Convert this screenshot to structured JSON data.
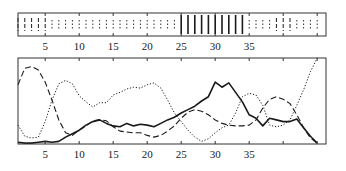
{
  "figure": {
    "width": 346,
    "height": 171,
    "line_color": "#1a1a1a",
    "frame_color": "#333333"
  },
  "chart_data": [
    {
      "type": "strip",
      "title": "",
      "xlabel": "",
      "ylabel": "",
      "xlim": [
        1,
        46.3
      ],
      "x_ticks": [
        5,
        10,
        15,
        20,
        25,
        30,
        35,
        40,
        45
      ],
      "x_tick_labels": [
        "5",
        "10",
        "15",
        "20",
        "25",
        "30",
        "35",
        "",
        ""
      ],
      "grid": false,
      "legend": null,
      "markers": [
        {
          "x": 1,
          "style": "dashed"
        },
        {
          "x": 2,
          "style": "dashed"
        },
        {
          "x": 3,
          "style": "dashed"
        },
        {
          "x": 4,
          "style": "dashed"
        },
        {
          "x": 5,
          "style": "dashed"
        },
        {
          "x": 6,
          "style": "dotted"
        },
        {
          "x": 7,
          "style": "dotted"
        },
        {
          "x": 8,
          "style": "dotted"
        },
        {
          "x": 9,
          "style": "dotted"
        },
        {
          "x": 10,
          "style": "dotted"
        },
        {
          "x": 11,
          "style": "dotted"
        },
        {
          "x": 12,
          "style": "dotted"
        },
        {
          "x": 13,
          "style": "dotted"
        },
        {
          "x": 14,
          "style": "dotted"
        },
        {
          "x": 15,
          "style": "dotted"
        },
        {
          "x": 16,
          "style": "dotted"
        },
        {
          "x": 17,
          "style": "dotted"
        },
        {
          "x": 18,
          "style": "dotted"
        },
        {
          "x": 19,
          "style": "dotted"
        },
        {
          "x": 20,
          "style": "dotted"
        },
        {
          "x": 21,
          "style": "dotted"
        },
        {
          "x": 22,
          "style": "dotted"
        },
        {
          "x": 23,
          "style": "dotted"
        },
        {
          "x": 24,
          "style": "dotted"
        },
        {
          "x": 25,
          "style": "solid"
        },
        {
          "x": 26,
          "style": "solid"
        },
        {
          "x": 27,
          "style": "solid"
        },
        {
          "x": 28,
          "style": "solid"
        },
        {
          "x": 29,
          "style": "solid"
        },
        {
          "x": 30,
          "style": "solid"
        },
        {
          "x": 31,
          "style": "solid"
        },
        {
          "x": 32,
          "style": "solid"
        },
        {
          "x": 33,
          "style": "solid"
        },
        {
          "x": 34,
          "style": "solid"
        },
        {
          "x": 35,
          "style": "dotted"
        },
        {
          "x": 36,
          "style": "dotted"
        },
        {
          "x": 37,
          "style": "dotted"
        },
        {
          "x": 38,
          "style": "dotted"
        },
        {
          "x": 39,
          "style": "dashed"
        },
        {
          "x": 40,
          "style": "dashed"
        },
        {
          "x": 41,
          "style": "dashed"
        },
        {
          "x": 42,
          "style": "dotted"
        },
        {
          "x": 43,
          "style": "dotted"
        },
        {
          "x": 44,
          "style": "dotted"
        },
        {
          "x": 45,
          "style": "dotted"
        }
      ]
    },
    {
      "type": "line",
      "title": "",
      "xlabel": "",
      "ylabel": "",
      "xlim": [
        1,
        46.3
      ],
      "ylim": [
        0,
        1
      ],
      "x_ticks": [
        5,
        10,
        15,
        20,
        25,
        30,
        35,
        40,
        45
      ],
      "x_tick_labels": [
        "5",
        "10",
        "15",
        "20",
        "25",
        "30",
        "35",
        "",
        ""
      ],
      "grid": false,
      "legend": null,
      "x": [
        1,
        2,
        3,
        4,
        5,
        6,
        7,
        8,
        9,
        10,
        11,
        12,
        13,
        14,
        15,
        16,
        17,
        18,
        19,
        20,
        21,
        22,
        23,
        24,
        25,
        26,
        27,
        28,
        29,
        30,
        31,
        32,
        33,
        34,
        35,
        36,
        37,
        38,
        39,
        40,
        41,
        42,
        43,
        44,
        45
      ],
      "series": [
        {
          "name": "solid",
          "style": "solid",
          "values": [
            0.02,
            0.01,
            0.01,
            0.02,
            0.03,
            0.02,
            0.03,
            0.08,
            0.12,
            0.16,
            0.22,
            0.26,
            0.28,
            0.24,
            0.21,
            0.2,
            0.24,
            0.21,
            0.23,
            0.22,
            0.2,
            0.24,
            0.28,
            0.31,
            0.36,
            0.4,
            0.44,
            0.5,
            0.55,
            0.72,
            0.66,
            0.71,
            0.6,
            0.49,
            0.34,
            0.3,
            0.21,
            0.3,
            0.28,
            0.26,
            0.26,
            0.29,
            0.19,
            0.09,
            0.01
          ]
        },
        {
          "name": "dashed",
          "style": "dashed",
          "values": [
            0.69,
            0.88,
            0.9,
            0.86,
            0.72,
            0.51,
            0.28,
            0.13,
            0.1,
            0.16,
            0.21,
            0.27,
            0.28,
            0.27,
            0.2,
            0.15,
            0.14,
            0.13,
            0.13,
            0.1,
            0.08,
            0.1,
            0.15,
            0.21,
            0.3,
            0.37,
            0.4,
            0.38,
            0.34,
            0.28,
            0.24,
            0.22,
            0.21,
            0.21,
            0.22,
            0.28,
            0.42,
            0.52,
            0.55,
            0.52,
            0.47,
            0.34,
            0.19,
            0.07,
            0.01
          ]
        },
        {
          "name": "dotted",
          "style": "dotted",
          "values": [
            0.22,
            0.09,
            0.07,
            0.08,
            0.26,
            0.51,
            0.7,
            0.74,
            0.7,
            0.56,
            0.49,
            0.43,
            0.48,
            0.48,
            0.57,
            0.6,
            0.64,
            0.66,
            0.65,
            0.69,
            0.71,
            0.65,
            0.51,
            0.36,
            0.26,
            0.16,
            0.08,
            0.03,
            0.06,
            0.13,
            0.19,
            0.22,
            0.36,
            0.55,
            0.59,
            0.57,
            0.45,
            0.22,
            0.2,
            0.22,
            0.28,
            0.45,
            0.63,
            0.84,
            1.0
          ]
        }
      ]
    }
  ]
}
